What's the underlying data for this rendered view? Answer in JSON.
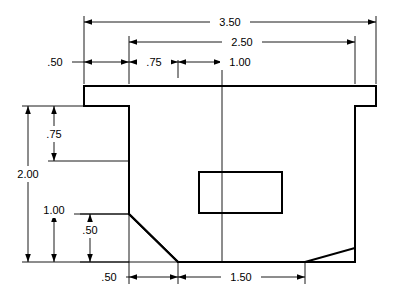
{
  "drawing": {
    "title": "mechanical-part-dimensioned-drawing",
    "units": "inches",
    "line_color": "#000000",
    "background_color": "#ffffff",
    "dimensions": [
      {
        "id": "overall-width",
        "value": "3.50",
        "orientation": "horizontal",
        "position": "top"
      },
      {
        "id": "inner-width",
        "value": "2.50",
        "orientation": "horizontal",
        "position": "top"
      },
      {
        "id": "left-flange-width",
        "value": ".50",
        "orientation": "horizontal",
        "position": "top"
      },
      {
        "id": "left-offset",
        "value": ".75",
        "orientation": "horizontal",
        "position": "top"
      },
      {
        "id": "pocket-offset",
        "value": "1.00",
        "orientation": "horizontal",
        "position": "top"
      },
      {
        "id": "overall-height",
        "value": "2.00",
        "orientation": "vertical",
        "position": "left"
      },
      {
        "id": "upper-height",
        "value": ".75",
        "orientation": "vertical",
        "position": "left"
      },
      {
        "id": "lower-height",
        "value": "1.00",
        "orientation": "vertical",
        "position": "left"
      },
      {
        "id": "chamfer-height",
        "value": ".50",
        "orientation": "vertical",
        "position": "left"
      },
      {
        "id": "chamfer-width",
        "value": ".50",
        "orientation": "horizontal",
        "position": "bottom"
      },
      {
        "id": "bottom-width",
        "value": "1.50",
        "orientation": "horizontal",
        "position": "bottom"
      }
    ]
  }
}
